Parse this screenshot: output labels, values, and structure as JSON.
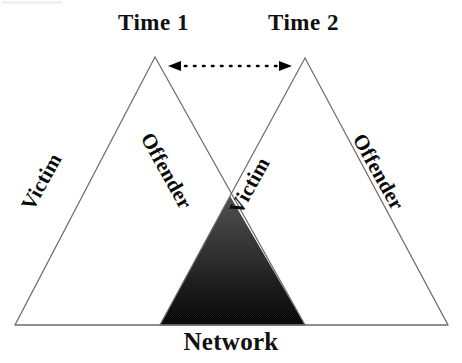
{
  "diagram": {
    "title_labels": {
      "time1": "Time 1",
      "time2": "Time 2"
    },
    "bottom_label": "Network",
    "edge_labels": {
      "triangle1_left": "Victim",
      "triangle1_right": "Offender",
      "triangle2_left": "Victim",
      "triangle2_right": "Offender"
    },
    "colors": {
      "outline": "#6b6b6b",
      "overlap_top": "#3d3d3d",
      "overlap_bottom": "#000000",
      "text": "#0a0a0a",
      "background": "#ffffff",
      "arrow": "#000000"
    },
    "geometry": {
      "triangle1_apex": [
        155,
        57
      ],
      "triangle1_left_base": [
        15,
        325
      ],
      "triangle1_right_base": [
        305,
        325
      ],
      "triangle2_apex": [
        305,
        58
      ],
      "triangle2_left_base": [
        160,
        325
      ],
      "triangle2_right_base": [
        448,
        325
      ],
      "overlap_apex": [
        230,
        196
      ],
      "overlap_base_left": [
        160,
        325
      ],
      "overlap_base_right": [
        305,
        325
      ],
      "arrow_start": [
        168,
        66
      ],
      "arrow_end": [
        292,
        66
      ]
    },
    "arrow": {
      "style": "dotted",
      "heads": "double"
    }
  }
}
